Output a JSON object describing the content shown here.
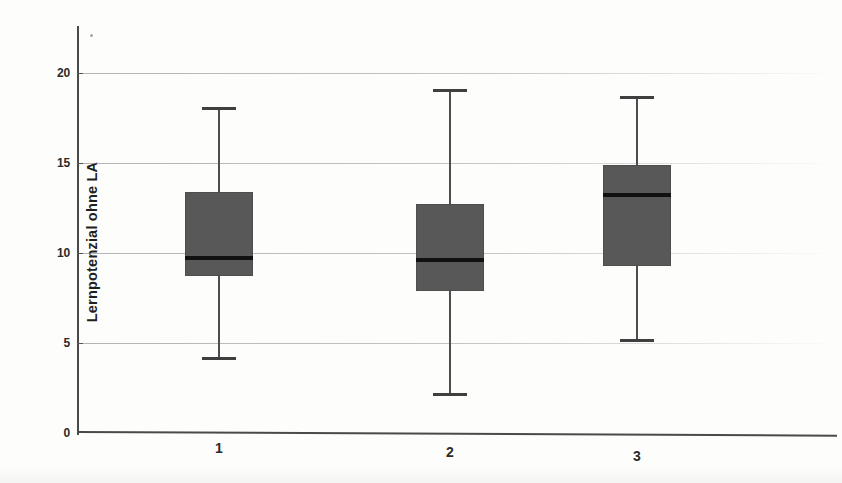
{
  "chart_data": {
    "type": "box",
    "title": "",
    "xlabel": "",
    "ylabel": "Lernpotenzial ohne LA",
    "categories": [
      "1",
      "2",
      "3"
    ],
    "ylim": [
      0,
      21.5
    ],
    "yticks": [
      0,
      5,
      10,
      15,
      20
    ],
    "ytick_labels": [
      "0",
      "5",
      "10",
      "15",
      "20"
    ],
    "grid": true,
    "legend": "none",
    "box_fill_color": "#585858",
    "median_color": "#111111",
    "whisker_color": "#4d4d4d",
    "axis_color": "#4a4a4a",
    "boxes": [
      {
        "category": "1",
        "whisker_low": 4.2,
        "q1": 8.7,
        "median": 9.7,
        "q3": 13.4,
        "whisker_high": 18.1
      },
      {
        "category": "2",
        "whisker_low": 2.2,
        "q1": 7.9,
        "median": 9.6,
        "q3": 12.7,
        "whisker_high": 19.1
      },
      {
        "category": "3",
        "whisker_low": 5.2,
        "q1": 9.3,
        "median": 13.2,
        "q3": 14.9,
        "whisker_high": 18.7
      }
    ]
  }
}
